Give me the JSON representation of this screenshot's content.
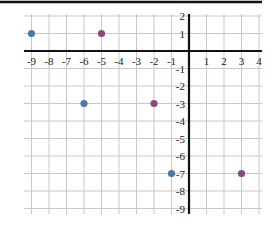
{
  "chart_data": {
    "type": "scatter",
    "title": "",
    "xlabel": "",
    "ylabel": "",
    "xlim": [
      -9.5,
      4
    ],
    "ylim": [
      -9,
      2
    ],
    "grid": true,
    "x_ticks": [
      -9,
      -8,
      -7,
      -6,
      -5,
      -4,
      -3,
      -2,
      -1,
      1,
      2,
      3,
      4
    ],
    "y_ticks": [
      2,
      1,
      -1,
      -2,
      -3,
      -4,
      -5,
      -6,
      -7,
      -8,
      -9
    ],
    "series": [
      {
        "name": "blue points",
        "color": "#4a78a8",
        "points": [
          {
            "x": -9,
            "y": 1
          },
          {
            "x": -6,
            "y": -3
          },
          {
            "x": -1,
            "y": -7
          }
        ]
      },
      {
        "name": "purple points",
        "color": "#8a4a78",
        "points": [
          {
            "x": -5,
            "y": 1
          },
          {
            "x": -2,
            "y": -3
          },
          {
            "x": 3,
            "y": -7
          }
        ]
      }
    ]
  },
  "colors": {
    "grid": "#c8c8c8",
    "axis": "#111111",
    "border": "#111111"
  }
}
